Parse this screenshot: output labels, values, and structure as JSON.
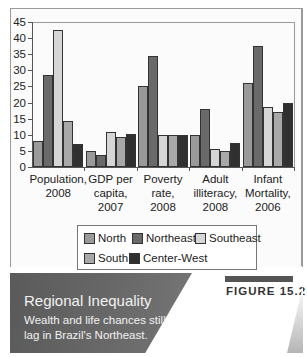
{
  "chart_data": {
    "type": "bar",
    "title": "",
    "xlabel": "",
    "ylabel": "",
    "ylim": [
      0,
      45
    ],
    "yticks": [
      0,
      5,
      10,
      15,
      20,
      25,
      30,
      35,
      40,
      45
    ],
    "grid": false,
    "legend_position": "bottom",
    "categories": [
      "Population, 2008",
      "GDP per capita, 2007",
      "Poverty rate, 2008",
      "Adult illiteracy, 2008",
      "Infant Mortality, 2006"
    ],
    "category_lines": [
      [
        "Population,",
        "2008"
      ],
      [
        "GDP per",
        "capita,",
        "2007"
      ],
      [
        "Poverty",
        "rate,",
        "2008"
      ],
      [
        "Adult",
        "illiteracy,",
        "2008"
      ],
      [
        "Infant",
        "Mortality,",
        "2006"
      ]
    ],
    "series": [
      {
        "name": "North",
        "color": "#9a9a9a",
        "values": [
          8,
          5,
          25,
          10,
          26
        ]
      },
      {
        "name": "Northeast",
        "color": "#6a6a6a",
        "values": [
          28.5,
          3.8,
          34.5,
          18,
          37.5
        ]
      },
      {
        "name": "Southeast",
        "color": "#d6d6d6",
        "values": [
          42.5,
          11,
          10,
          5.5,
          18.5
        ]
      },
      {
        "name": "South",
        "color": "#a8a8a8",
        "values": [
          14.3,
          9.4,
          10,
          5,
          17
        ]
      },
      {
        "name": "Center-West",
        "color": "#303030",
        "values": [
          7,
          10.2,
          10,
          7.5,
          19.8
        ]
      }
    ]
  },
  "legend": {
    "items": [
      "North",
      "Northeast",
      "Southeast",
      "South",
      "Center-West"
    ]
  },
  "caption": {
    "figure_label": "FIGURE 15.2",
    "title": "Regional Inequality",
    "subtitle": "Wealth and life chances still lag in Brazil's Northeast."
  }
}
